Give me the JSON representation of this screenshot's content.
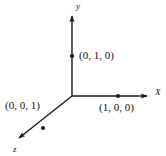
{
  "figure": {
    "background_color": "#ffffff",
    "stroke_color": "#1a1a1a",
    "width": 166,
    "height": 156
  },
  "axes": [
    {
      "id": "y",
      "label": "y",
      "direction": "up",
      "origin": [
        72,
        96
      ],
      "tip": [
        72,
        10
      ],
      "arrow": true
    },
    {
      "id": "x",
      "label": "X",
      "direction": "right",
      "origin": [
        72,
        96
      ],
      "tip": [
        153,
        96
      ],
      "arrow": true
    },
    {
      "id": "z",
      "label": "z",
      "direction": "down-left",
      "origin": [
        72,
        96
      ],
      "tip": [
        15,
        141
      ],
      "arrow": true
    }
  ],
  "points": [
    {
      "id": "unit-y",
      "label": "(0, 1, 0)",
      "coords": [
        0,
        1,
        0
      ],
      "marker": [
        72,
        56
      ]
    },
    {
      "id": "unit-x",
      "label": "(1, 0, 0)",
      "coords": [
        1,
        0,
        0
      ],
      "marker": [
        118,
        96
      ]
    },
    {
      "id": "unit-z",
      "label": "(0, 0, 1)",
      "coords": [
        0,
        0,
        1
      ],
      "marker": [
        43,
        128
      ]
    }
  ],
  "origin": {
    "label": "O",
    "coords": [
      0,
      0,
      0
    ],
    "position": [
      72,
      96
    ]
  }
}
